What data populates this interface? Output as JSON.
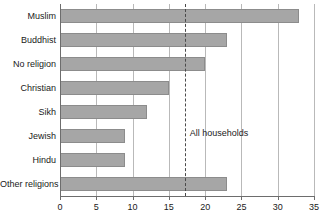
{
  "chart_data": {
    "type": "bar",
    "orientation": "horizontal",
    "title": "",
    "subtitle": "",
    "xlabel": "",
    "ylabel": "",
    "xlim": [
      0,
      35
    ],
    "ylim": null,
    "grid": true,
    "legend": null,
    "categories": [
      "Muslim",
      "Buddhist",
      "No religion",
      "Christian",
      "Sikh",
      "Jewish",
      "Hindu",
      "Other religions"
    ],
    "values": [
      33,
      23,
      20,
      15,
      12,
      9,
      9,
      23
    ],
    "tick_labels": [
      "0",
      "5",
      "10",
      "15",
      "20",
      "25",
      "30",
      "35"
    ],
    "tick_values": [
      0,
      5,
      10,
      15,
      20,
      25,
      30,
      35
    ],
    "annotations": [
      {
        "name": "all-households-reference",
        "label": "All households",
        "value": 17.2,
        "style": "dashed-vertical"
      }
    ],
    "colors": {
      "bar_fill": "#a6a6a6",
      "bar_stroke": "#8c8c8c",
      "gridline": "#b9b9b9",
      "axis": "#6d6d6d",
      "reference_line": "#4a4a4a",
      "text": "#1a1a1a",
      "background": "#ffffff"
    }
  }
}
